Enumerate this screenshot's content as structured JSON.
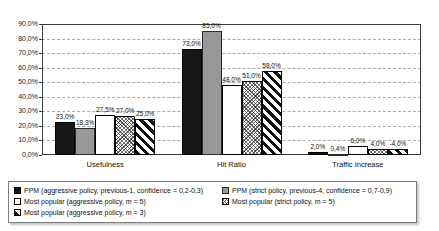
{
  "figure": {
    "background": "#ffffff"
  },
  "chart_data": {
    "type": "bar",
    "title": "",
    "xlabel": "",
    "ylabel": "",
    "categories": [
      "Usefulness",
      "Hit Ratio",
      "Traffic Increase"
    ],
    "series": [
      {
        "name": "PPM (aggressive policy, previous-1, confidence = 0,2-0,3)",
        "style": "solid-black",
        "values": [
          23.0,
          73.0,
          2.0
        ],
        "value_labels": [
          "23,0%",
          "73,0%",
          "2,0%"
        ]
      },
      {
        "name": "PPM (strict policy, previous-4, confidence = 0,7-0,9)",
        "style": "solid-gray",
        "values": [
          18.3,
          85.0,
          0.4
        ],
        "value_labels": [
          "18,3%",
          "85,0%",
          "0,4%"
        ]
      },
      {
        "name": "Most popular (aggressive policy, m = 5)",
        "style": "white-outline",
        "values": [
          27.5,
          48.0,
          6.0
        ],
        "value_labels": [
          "27,5%",
          "48,0%",
          "6,0%"
        ]
      },
      {
        "name": "Most popular (strict policy, m = 5)",
        "style": "fine-crosshatch",
        "values": [
          27.0,
          51.0,
          4.0
        ],
        "value_labels": [
          "27,0%",
          "51,0%",
          "4,0%"
        ]
      },
      {
        "name": "Most popular (aggressive policy, m = 3)",
        "style": "diagonal-stripes",
        "values": [
          25.0,
          58.0,
          -4.0
        ],
        "value_labels": [
          "25,0%",
          "58,0%",
          "-4,0%"
        ]
      }
    ],
    "y_axis": {
      "min": 0,
      "max": 90,
      "step": 10,
      "tick_labels": [
        "0,0%",
        "10,0%",
        "20,0%",
        "30,0%",
        "40,0%",
        "50,0%",
        "60,0%",
        "70,0%",
        "80,0%",
        "90,0%"
      ]
    },
    "grid": "horizontal-dashed",
    "legend_position": "bottom"
  },
  "colors": {
    "bar_black": "#161616",
    "bar_gray": "#989898",
    "bar_white": "#ffffff",
    "bar_border": "#000000",
    "grid_line": "#ababab",
    "plot_frame": "#3c3c3c",
    "legend_border": "#7d7d7d",
    "text": "#101010"
  }
}
